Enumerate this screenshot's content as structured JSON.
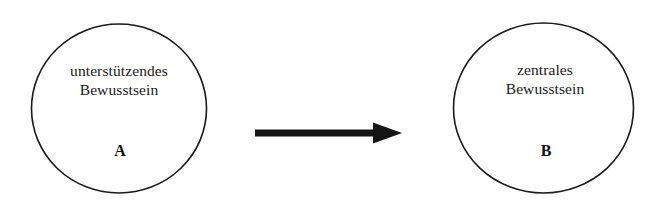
{
  "diagram": {
    "type": "flow",
    "background_color": "#ffffff",
    "stroke_color": "#1a1a1a",
    "text_color": "#1a1a1a",
    "nodes": [
      {
        "id": "A",
        "shape": "circle",
        "tag": "A",
        "title_line_1": "unterstützendes",
        "title_line_2": "Bewusstsein",
        "cx": 119,
        "cy": 108,
        "rx": 88,
        "ry": 84.5
      },
      {
        "id": "B",
        "shape": "circle",
        "tag": "B",
        "title_line_1": "zentrales",
        "title_line_2": "Bewusstsein",
        "cx": 543,
        "cy": 108,
        "rx": 90,
        "ry": 85
      }
    ],
    "connector": {
      "kind": "arrow",
      "direction": "left-to-right",
      "from": "A",
      "to": "B",
      "x_start": 256,
      "x_end": 402,
      "y": 133,
      "shaft_thickness": 7,
      "color": "#151515"
    }
  }
}
